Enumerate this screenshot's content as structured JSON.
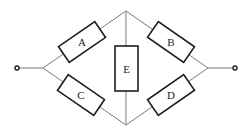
{
  "diagram": {
    "type": "bridge-circuit",
    "colors": {
      "wire": "#7a7a7a",
      "component_outline": "#1e1e1e",
      "background": "#ffffff"
    },
    "components": [
      {
        "id": "A",
        "label": "A",
        "kind": "resistor",
        "between": [
          "left-node",
          "top-node"
        ]
      },
      {
        "id": "B",
        "label": "B",
        "kind": "resistor",
        "between": [
          "top-node",
          "right-node"
        ]
      },
      {
        "id": "C",
        "label": "C",
        "kind": "resistor",
        "between": [
          "left-node",
          "bottom-node"
        ]
      },
      {
        "id": "D",
        "label": "D",
        "kind": "resistor",
        "between": [
          "bottom-node",
          "right-node"
        ]
      },
      {
        "id": "E",
        "label": "E",
        "kind": "resistor",
        "between": [
          "top-node",
          "bottom-node"
        ]
      }
    ],
    "terminals": [
      "left-terminal",
      "right-terminal"
    ]
  }
}
